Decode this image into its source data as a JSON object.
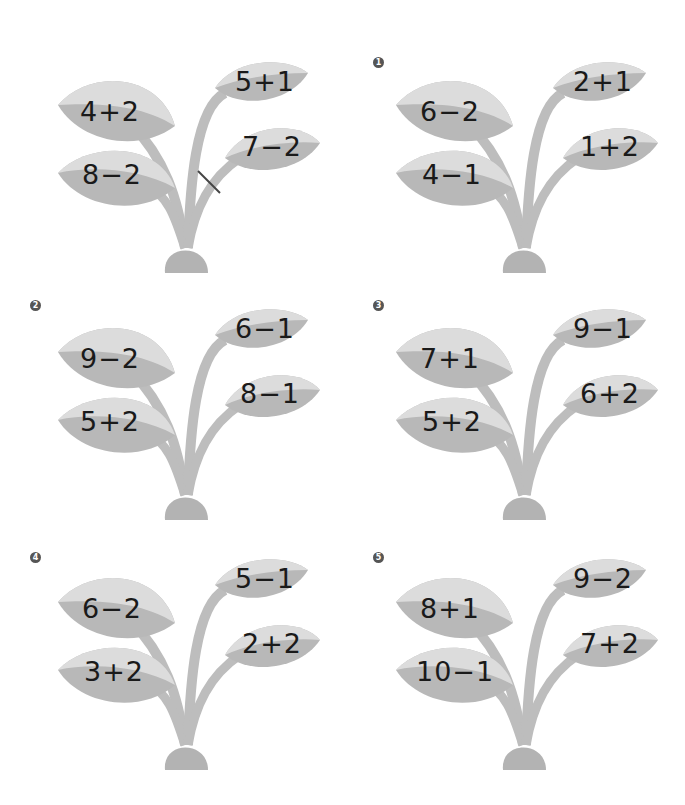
{
  "worksheet": {
    "colors": {
      "leaf_light": "#dcdcdc",
      "leaf_dark": "#b8b8b8",
      "stem": "#bdbdbd",
      "pot": "#b3b3b3",
      "text": "#1a1a1a",
      "badge": "#555555"
    },
    "plants": [
      {
        "badge": "",
        "is_example": true,
        "leaves": {
          "upper_left": "4+2",
          "lower_left": "8−2",
          "upper_right": "5+1",
          "lower_right": "7−2"
        },
        "marked_stem": "lower_right"
      },
      {
        "badge": "1",
        "leaves": {
          "upper_left": "6−2",
          "lower_left": "4−1",
          "upper_right": "2+1",
          "lower_right": "1+2"
        }
      },
      {
        "badge": "2",
        "leaves": {
          "upper_left": "9−2",
          "lower_left": "5+2",
          "upper_right": "6−1",
          "lower_right": "8−1"
        }
      },
      {
        "badge": "3",
        "leaves": {
          "upper_left": "7+1",
          "lower_left": "5+2",
          "upper_right": "9−1",
          "lower_right": "6+2"
        }
      },
      {
        "badge": "4",
        "leaves": {
          "upper_left": "6−2",
          "lower_left": "3+2",
          "upper_right": "5−1",
          "lower_right": "2+2"
        }
      },
      {
        "badge": "5",
        "leaves": {
          "upper_left": "8+1",
          "lower_left": "10−1",
          "upper_right": "9−2",
          "lower_right": "7+2"
        }
      }
    ]
  }
}
